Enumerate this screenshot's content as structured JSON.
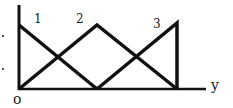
{
  "figure": {
    "type": "membership-functions-diagram",
    "origin_label": "o",
    "x_axis_label": "y",
    "line_color": "#111111",
    "curves": [
      {
        "label": "1",
        "shape": "decreasing",
        "points": [
          [
            0,
            1
          ],
          [
            1,
            0
          ]
        ]
      },
      {
        "label": "2",
        "shape": "triangle",
        "points": [
          [
            0,
            0
          ],
          [
            1,
            1
          ],
          [
            2,
            0
          ]
        ]
      },
      {
        "label": "3",
        "shape": "right-triangle",
        "points": [
          [
            1,
            0
          ],
          [
            2,
            1
          ],
          [
            2,
            0
          ]
        ]
      }
    ]
  }
}
